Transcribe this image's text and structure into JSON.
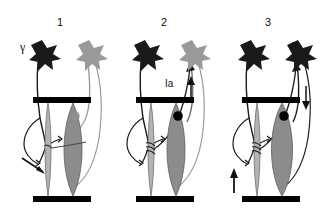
{
  "figure": {
    "background_color": "#ffffff",
    "line_color": "#1a1a1a",
    "tendon_color": "#000000",
    "extrafusal_fill": "#8c8c8c",
    "intrafusal_fill": "#b3b3b3",
    "active_neuron_color": "#1a1a1a",
    "inactive_neuron_color": "#9a9a9a",
    "active_terminal_color": "#000000",
    "inactive_terminal_color": "#8f8f8f"
  },
  "panels": [
    {
      "number": "1",
      "labels": {
        "gamma": "γ",
        "ia": "",
        "alpha": ""
      },
      "gamma_neuron_state": "active",
      "alpha_neuron_state": "inactive",
      "alpha_terminal_state": "inactive",
      "arrows": [
        {
          "name": "spindle-shortening-arrow",
          "direction": "diagonal-down-right"
        }
      ]
    },
    {
      "number": "2",
      "labels": {
        "gamma": "",
        "ia": "Ia",
        "alpha": ""
      },
      "gamma_neuron_state": "active",
      "alpha_neuron_state": "inactive",
      "alpha_terminal_state": "active",
      "arrows": [
        {
          "name": "ia-afferent-up-arrow",
          "direction": "up"
        }
      ]
    },
    {
      "number": "3",
      "labels": {
        "gamma": "",
        "ia": "",
        "alpha": "α"
      },
      "gamma_neuron_state": "active",
      "alpha_neuron_state": "active",
      "alpha_terminal_state": "active",
      "arrows": [
        {
          "name": "muscle-contraction-up-arrow",
          "direction": "up"
        },
        {
          "name": "ia-afferent-down-arrow",
          "direction": "down"
        }
      ]
    }
  ]
}
